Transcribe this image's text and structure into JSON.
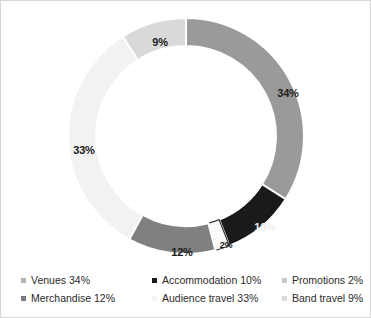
{
  "chart_data": {
    "type": "pie",
    "variant": "donut",
    "title": "",
    "xlabel": "",
    "ylabel": "",
    "legend_position": "bottom",
    "grid": false,
    "total": 100,
    "units": "%",
    "start_angle_deg": 0,
    "direction": "clockwise",
    "categories": [
      "Venues",
      "Accommodation",
      "Promotions",
      "Merchandise",
      "Audience travel",
      "Band travel"
    ],
    "values": [
      34,
      10,
      2,
      12,
      33,
      9
    ],
    "slice_labels": [
      "34%",
      "10%",
      "2%",
      "12%",
      "33%",
      "9%"
    ],
    "colors": [
      "#9a9a9a",
      "#1a1a1a",
      "#fafafa",
      "#808080",
      "#f2f2f2",
      "#d9d9d9"
    ],
    "slices": [
      {
        "name": "Venues",
        "value": 34,
        "label": "34%",
        "color": "#9a9a9a",
        "stroke": "#ffffff",
        "label_x": 287,
        "label_y": 92
      },
      {
        "name": "Accommodation",
        "value": 10,
        "label": "10%",
        "color": "#1a1a1a",
        "stroke": "#ffffff",
        "label_text_color": "#f0f0f0",
        "label_x": 264,
        "label_y": 226
      },
      {
        "name": "Promotions",
        "value": 2,
        "label": "2%",
        "color": "#fafafa",
        "stroke": "#3c3c3c",
        "label_x": 225,
        "label_y": 244
      },
      {
        "name": "Merchandise",
        "value": 12,
        "label": "12%",
        "color": "#808080",
        "stroke": "#ffffff",
        "label_x": 181,
        "label_y": 251
      },
      {
        "name": "Audience travel",
        "value": 33,
        "label": "33%",
        "color": "#f2f2f2",
        "stroke": "#ffffff",
        "label_x": 83,
        "label_y": 149
      },
      {
        "name": "Band travel",
        "value": 9,
        "label": "9%",
        "color": "#d9d9d9",
        "stroke": "#ffffff",
        "label_x": 159,
        "label_y": 41
      }
    ]
  },
  "legend": {
    "items": [
      {
        "label": "Venues 34%",
        "color": "#b3b3b3",
        "column": 1,
        "row": 1
      },
      {
        "label": "Merchandise 12%",
        "color": "#7d7d7d",
        "column": 1,
        "row": 2
      },
      {
        "label": "Accommodation 10%",
        "color": "#1a1a1a",
        "column": 2,
        "row": 1
      },
      {
        "label": "Audience travel 33%",
        "color": "#f4f4f4",
        "column": 2,
        "row": 2
      },
      {
        "label": "Promotions 2%",
        "color": "#c9c9c9",
        "column": 3,
        "row": 1
      },
      {
        "label": "Band travel 9%",
        "color": "#dcdcdc",
        "column": 3,
        "row": 2
      }
    ]
  }
}
